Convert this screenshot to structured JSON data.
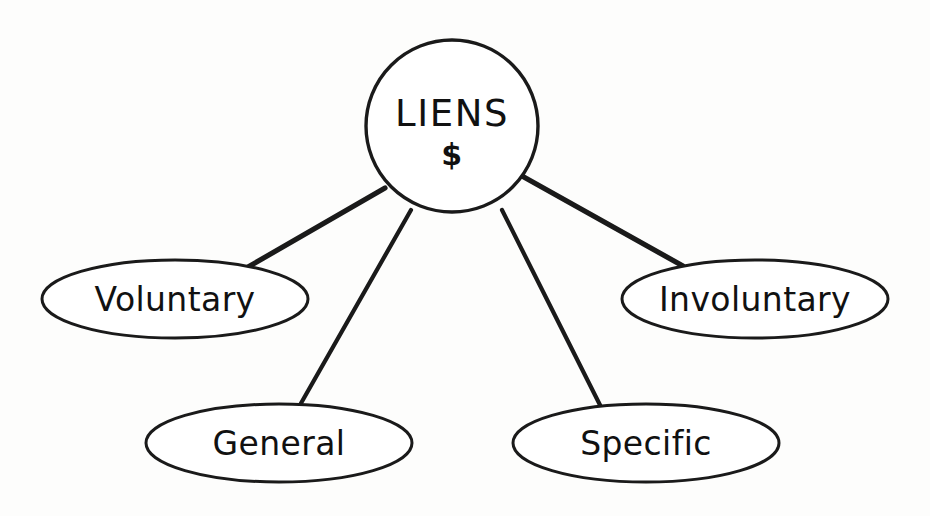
{
  "diagram": {
    "title": "Liens",
    "type": "hierarchy-tree",
    "background_color": "#fdfdfc",
    "stroke_color": "#1a1a1a",
    "fill_color": "#ffffff",
    "root": {
      "id": "liens",
      "shape": "circle",
      "label_line1": "LIENS",
      "label_line2": "$",
      "center_x": 452,
      "center_y": 126,
      "radius": 86
    },
    "branches": [
      {
        "id": "voluntary",
        "shape": "ellipse",
        "label": "Voluntary",
        "center_x": 175,
        "center_y": 299,
        "rx": 133,
        "ry": 39
      },
      {
        "id": "general",
        "shape": "ellipse",
        "label": "General",
        "center_x": 279,
        "center_y": 443,
        "rx": 133,
        "ry": 39
      },
      {
        "id": "specific",
        "shape": "ellipse",
        "label": "Specific",
        "center_x": 646,
        "center_y": 443,
        "rx": 133,
        "ry": 39
      },
      {
        "id": "involuntary",
        "shape": "ellipse",
        "label": "Involuntary",
        "center_x": 755,
        "center_y": 299,
        "rx": 133,
        "ry": 39
      }
    ],
    "connectors": [
      {
        "id": "liens-to-voluntary",
        "from": "liens",
        "to": "voluntary",
        "x1": 385,
        "y1": 188,
        "x2": 248,
        "y2": 267
      },
      {
        "id": "liens-to-general",
        "from": "liens",
        "to": "general",
        "x1": 411,
        "y1": 210,
        "x2": 300,
        "y2": 405
      },
      {
        "id": "liens-to-specific",
        "from": "liens",
        "to": "specific",
        "x1": 502,
        "y1": 210,
        "x2": 600,
        "y2": 405
      },
      {
        "id": "liens-to-involuntary",
        "from": "liens",
        "to": "involuntary",
        "x1": 522,
        "y1": 176,
        "x2": 683,
        "y2": 266
      }
    ]
  }
}
